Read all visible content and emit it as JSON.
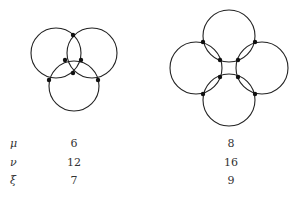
{
  "figures": [
    {
      "name": "three-circles",
      "circles": [
        {
          "cx": 56,
          "cy": 53,
          "r": 25
        },
        {
          "cx": 92,
          "cy": 53,
          "r": 25
        },
        {
          "cx": 74,
          "cy": 86,
          "r": 25
        }
      ],
      "vertices": [
        [
          73,
          35
        ],
        [
          65,
          60
        ],
        [
          81,
          60
        ],
        [
          73,
          73
        ],
        [
          49,
          80
        ],
        [
          98,
          80
        ]
      ]
    },
    {
      "name": "four-circles",
      "circles": [
        {
          "cx": 229,
          "cy": 36,
          "r": 26
        },
        {
          "cx": 196,
          "cy": 68,
          "r": 26
        },
        {
          "cx": 262,
          "cy": 68,
          "r": 26
        },
        {
          "cx": 229,
          "cy": 100,
          "r": 26
        }
      ],
      "vertices": [
        [
          203,
          42
        ],
        [
          255,
          42
        ],
        [
          220,
          60
        ],
        [
          238,
          60
        ],
        [
          220,
          77
        ],
        [
          238,
          77
        ],
        [
          203,
          94
        ],
        [
          255,
          94
        ]
      ]
    }
  ],
  "table": {
    "rows": [
      {
        "label": "μ",
        "values": [
          "6",
          "8"
        ]
      },
      {
        "label": "ν",
        "values": [
          "12",
          "16"
        ]
      },
      {
        "label": "ξ",
        "values": [
          "7",
          "9"
        ]
      }
    ]
  },
  "colors": {
    "stroke": "#222222",
    "vertex": "#111111"
  }
}
